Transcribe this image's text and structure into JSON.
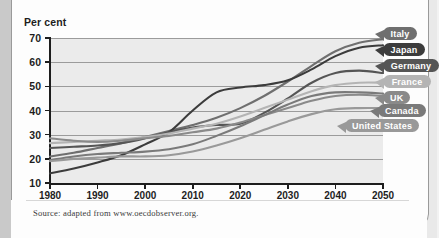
{
  "figure": {
    "y_axis_title": "Per cent",
    "source_note": "Source: adapted from www.oecdobserver.org."
  },
  "chart_data": {
    "type": "line",
    "title": "",
    "subtitle": "",
    "xlabel": "",
    "ylabel": "Per cent",
    "xlim": [
      1980,
      2050
    ],
    "ylim": [
      10,
      70
    ],
    "grid": true,
    "legend_position": "right-callouts",
    "x_ticks": [
      1980,
      1990,
      2000,
      2010,
      2020,
      2030,
      2040,
      2050
    ],
    "y_ticks": [
      10,
      20,
      30,
      40,
      50,
      60,
      70
    ],
    "x": [
      1980,
      1985,
      1990,
      1995,
      2000,
      2005,
      2010,
      2015,
      2020,
      2025,
      2030,
      2035,
      2040,
      2045,
      2050
    ],
    "series": [
      {
        "name": "Italy",
        "color": "#6f6f6f",
        "values": [
          21.0,
          22.5,
          24.5,
          26.5,
          29.0,
          31.5,
          34.0,
          37.0,
          41.0,
          46.0,
          52.0,
          58.5,
          64.5,
          68.0,
          69.5
        ]
      },
      {
        "name": "Japan",
        "color": "#3c3c3c",
        "values": [
          14.0,
          16.0,
          18.5,
          21.5,
          26.0,
          31.0,
          40.0,
          47.5,
          49.5,
          50.5,
          52.5,
          57.0,
          62.5,
          66.0,
          67.0
        ]
      },
      {
        "name": "Germany",
        "color": "#555555",
        "values": [
          24.5,
          25.0,
          25.5,
          26.5,
          28.5,
          31.0,
          33.0,
          34.0,
          34.5,
          39.0,
          45.0,
          51.5,
          55.5,
          56.5,
          55.5
        ]
      },
      {
        "name": "France",
        "color": "#b4b4b4",
        "values": [
          26.5,
          27.0,
          27.5,
          28.0,
          29.0,
          30.5,
          32.5,
          34.5,
          37.5,
          41.0,
          44.5,
          48.0,
          50.5,
          51.5,
          51.5
        ]
      },
      {
        "name": "UK",
        "color": "#8a8a8a",
        "values": [
          28.5,
          27.5,
          27.0,
          27.5,
          28.5,
          29.5,
          31.0,
          32.5,
          35.0,
          38.0,
          41.0,
          44.0,
          46.0,
          46.5,
          46.0
        ]
      },
      {
        "name": "Canada",
        "color": "#7a7a7a",
        "values": [
          19.5,
          21.0,
          22.0,
          22.5,
          23.0,
          24.0,
          26.0,
          29.5,
          33.5,
          38.0,
          42.5,
          46.0,
          47.5,
          47.5,
          47.0
        ]
      },
      {
        "name": "United States",
        "color": "#999999",
        "values": [
          19.0,
          20.0,
          20.5,
          21.0,
          21.0,
          21.5,
          23.0,
          25.5,
          28.5,
          32.0,
          35.5,
          38.5,
          40.5,
          41.0,
          41.0
        ]
      }
    ]
  },
  "legend_labels": [
    {
      "label": "Italy",
      "color": "#6f6f6f"
    },
    {
      "label": "Japan",
      "color": "#3c3c3c"
    },
    {
      "label": "Germany",
      "color": "#555555"
    },
    {
      "label": "France",
      "color": "#b4b4b4"
    },
    {
      "label": "UK",
      "color": "#8a8a8a"
    },
    {
      "label": "Canada",
      "color": "#7a7a7a"
    },
    {
      "label": "United States",
      "color": "#999999"
    }
  ]
}
